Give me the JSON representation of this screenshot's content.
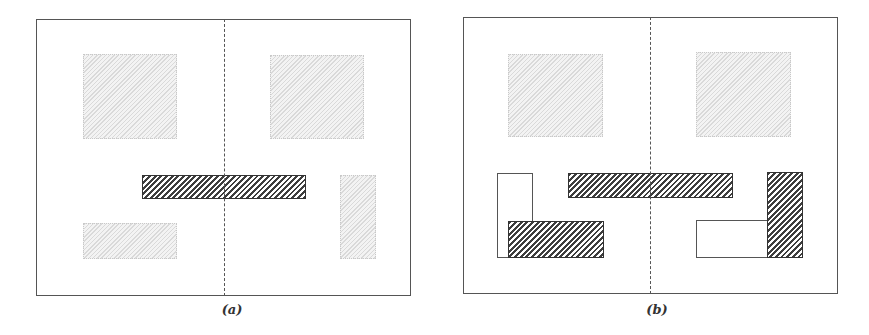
{
  "panels": [
    {
      "id": "a",
      "caption": "(a)",
      "frame": {
        "x": 36,
        "y": 19,
        "w": 375,
        "h": 277
      },
      "axis_x": 224,
      "caption_pos": {
        "x": 232,
        "y": 302
      },
      "shapes": [
        {
          "kind": "light",
          "name": "light-block-top-left",
          "x": 83,
          "y": 54,
          "w": 94,
          "h": 85
        },
        {
          "kind": "light",
          "name": "light-block-top-right",
          "x": 270,
          "y": 55,
          "w": 94,
          "h": 84
        },
        {
          "kind": "dark",
          "name": "dark-bar-center",
          "x": 142,
          "y": 175,
          "w": 164,
          "h": 24
        },
        {
          "kind": "light",
          "name": "light-block-right-vertical",
          "x": 340,
          "y": 175,
          "w": 36,
          "h": 84
        },
        {
          "kind": "light",
          "name": "light-block-bottom-left",
          "x": 83,
          "y": 223,
          "w": 94,
          "h": 36
        }
      ]
    },
    {
      "id": "b",
      "caption": "(b)",
      "frame": {
        "x": 463,
        "y": 17,
        "w": 375,
        "h": 277
      },
      "axis_x": 650,
      "caption_pos": {
        "x": 657,
        "y": 302
      },
      "shapes": [
        {
          "kind": "light",
          "name": "light-block-top-left",
          "x": 508,
          "y": 54,
          "w": 95,
          "h": 83
        },
        {
          "kind": "light",
          "name": "light-block-top-right",
          "x": 696,
          "y": 52,
          "w": 95,
          "h": 85
        },
        {
          "kind": "dark",
          "name": "dark-bar-center",
          "x": 568,
          "y": 173,
          "w": 165,
          "h": 25
        },
        {
          "kind": "outline",
          "name": "outline-block-left-vertical",
          "x": 497,
          "y": 173,
          "w": 36,
          "h": 85
        },
        {
          "kind": "dark",
          "name": "dark-block-bottom-left",
          "x": 508,
          "y": 221,
          "w": 96,
          "h": 37
        },
        {
          "kind": "outline",
          "name": "outline-block-right-horizontal",
          "x": 696,
          "y": 220,
          "w": 72,
          "h": 38
        },
        {
          "kind": "dark",
          "name": "dark-block-right-vertical",
          "x": 767,
          "y": 172,
          "w": 36,
          "h": 86
        }
      ]
    }
  ],
  "colors": {
    "frame": "#555555",
    "dark_hatch": "#3e3e3e",
    "light_hatch": "#aaaaaa",
    "background": "#ffffff"
  }
}
